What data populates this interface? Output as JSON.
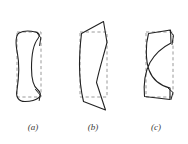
{
  "figure": {
    "title": "",
    "background_color": "#ffffff",
    "width": 188,
    "height": 144,
    "reference_outline_color": "#9a9a9a",
    "deformed_outline_color": "#222222",
    "caption_color": "#3a3a3a",
    "panels": [
      {
        "id": "panel-a",
        "label": "(a)",
        "label_x": 33,
        "label_y": 130,
        "deformation_type": "hourglass",
        "reference_rect": {
          "x": 17,
          "y": 32,
          "width": 24,
          "height": 65
        },
        "deformed_path": "M 18 33 C 15 35 15 42 17 52 C 19 62 19 72 17 90 C 15 97 18 101 24 101 C 31 101 37 100 40 97 C 42 95 41 92 38 90 C 33 87 31 80 31 68 C 31 55 33 43 38 38 C 41 35 40 33 36 32 C 30 31 22 31 18 33 Z",
        "tail_paths": [
          "M 37 33 L 41 38 L 40 45",
          "M 36 90 L 40 95 L 39 99"
        ]
      },
      {
        "id": "panel-b",
        "label": "(b)",
        "label_x": 93,
        "label_y": 130,
        "deformation_type": "shear-skew",
        "reference_rect": {
          "x": 80,
          "y": 32,
          "width": 27,
          "height": 65
        },
        "deformed_path": "M 81 33 L 103 22 L 107 42 C 104 55 99 70 96 82 L 105 110 L 83 101 C 80 88 79 76 79 64 C 79 52 80 42 81 33 Z",
        "tail_paths": []
      },
      {
        "id": "panel-c",
        "label": "(c)",
        "label_x": 156,
        "label_y": 130,
        "deformation_type": "bending",
        "reference_rect": {
          "x": 146,
          "y": 32,
          "width": 27,
          "height": 65
        },
        "deformed_path": "M 148 33 L 170 30 L 171 42 C 164 46 156 52 150 62 C 145 72 143 85 144 96 L 170 99 L 170 88 C 160 86 152 80 148 70 C 145 60 145 45 148 33 Z",
        "tail_paths": [
          "M 169 31 L 173 36 L 172 44",
          "M 168 88 L 173 93 L 171 99"
        ]
      }
    ]
  }
}
